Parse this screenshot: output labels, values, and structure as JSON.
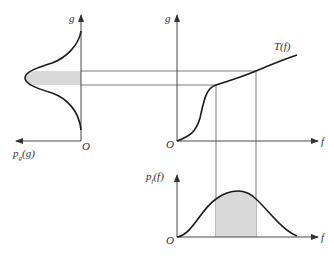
{
  "diagram": {
    "colors": {
      "line": "#1a1a1a",
      "axis": "#333333",
      "shade": "#d9d9d9",
      "background": "#ffffff"
    },
    "left_panel": {
      "vertical_axis_label": "g",
      "horizontal_axis_label": "p_g(g)",
      "horizontal_axis_label_main": "p",
      "horizontal_axis_label_sub": "g",
      "horizontal_axis_label_arg": "(g)",
      "origin_label": "O",
      "curve": "output density p_g(g), rotated, bell-shaped",
      "shaded_region": "band between two g levels"
    },
    "top_right_panel": {
      "vertical_axis_label": "g",
      "horizontal_axis_label": "f",
      "origin_label": "O",
      "curve_label": "T(f)"
    },
    "bottom_right_panel": {
      "vertical_axis_label": "p_f(f)",
      "vertical_axis_label_main": "p",
      "vertical_axis_label_sub": "f",
      "vertical_axis_label_arg": "(f)",
      "horizontal_axis_label": "f",
      "origin_label": "O",
      "curve": "input density p_f(f), bell-shaped",
      "shaded_region": "area between two f values"
    }
  }
}
